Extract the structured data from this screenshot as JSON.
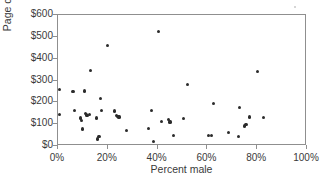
{
  "chart_data": {
    "type": "scatter",
    "title": "",
    "xlabel": "Percent male",
    "ylabel": "Page costs (thousands)",
    "xlim": [
      0,
      100
    ],
    "ylim": [
      0,
      600
    ],
    "xticks": [
      0,
      20,
      40,
      60,
      80,
      100
    ],
    "xtick_labels": [
      "0%",
      "20%",
      "40%",
      "60%",
      "80%",
      "100%"
    ],
    "yticks": [
      0,
      100,
      200,
      300,
      400,
      500,
      600
    ],
    "ytick_labels": [
      "$0",
      "$100",
      "$200",
      "$300",
      "$400",
      "$500",
      "$600"
    ],
    "grid": false,
    "legend": null,
    "marker_color": "#2b2b2b",
    "axis_color": "#8f8f8f",
    "points": [
      {
        "x": 0.5,
        "y": 258
      },
      {
        "x": 0.5,
        "y": 145
      },
      {
        "x": 6.0,
        "y": 250
      },
      {
        "x": 6.5,
        "y": 163
      },
      {
        "x": 9.0,
        "y": 128
      },
      {
        "x": 9.5,
        "y": 117
      },
      {
        "x": 10.0,
        "y": 78
      },
      {
        "x": 10.5,
        "y": 252
      },
      {
        "x": 11.0,
        "y": 148
      },
      {
        "x": 11.5,
        "y": 142
      },
      {
        "x": 12.0,
        "y": 138
      },
      {
        "x": 12.5,
        "y": 143
      },
      {
        "x": 13.0,
        "y": 345
      },
      {
        "x": 15.5,
        "y": 128
      },
      {
        "x": 16.0,
        "y": 32
      },
      {
        "x": 16.5,
        "y": 45
      },
      {
        "x": 17.0,
        "y": 218
      },
      {
        "x": 17.5,
        "y": 163
      },
      {
        "x": 19.8,
        "y": 460
      },
      {
        "x": 22.8,
        "y": 160
      },
      {
        "x": 23.5,
        "y": 140
      },
      {
        "x": 24.0,
        "y": 135
      },
      {
        "x": 24.5,
        "y": 133
      },
      {
        "x": 27.5,
        "y": 70
      },
      {
        "x": 36.5,
        "y": 80
      },
      {
        "x": 37.5,
        "y": 163
      },
      {
        "x": 38.5,
        "y": 22
      },
      {
        "x": 40.5,
        "y": 525
      },
      {
        "x": 41.5,
        "y": 113
      },
      {
        "x": 44.5,
        "y": 120
      },
      {
        "x": 45.0,
        "y": 110
      },
      {
        "x": 46.5,
        "y": 47
      },
      {
        "x": 50.5,
        "y": 127
      },
      {
        "x": 52.0,
        "y": 280
      },
      {
        "x": 60.5,
        "y": 48
      },
      {
        "x": 61.5,
        "y": 47
      },
      {
        "x": 62.5,
        "y": 193
      },
      {
        "x": 68.5,
        "y": 63
      },
      {
        "x": 72.5,
        "y": 45
      },
      {
        "x": 73.0,
        "y": 178
      },
      {
        "x": 75.0,
        "y": 92
      },
      {
        "x": 75.5,
        "y": 100
      },
      {
        "x": 77.0,
        "y": 133
      },
      {
        "x": 80.0,
        "y": 343
      },
      {
        "x": 82.5,
        "y": 130
      }
    ]
  }
}
